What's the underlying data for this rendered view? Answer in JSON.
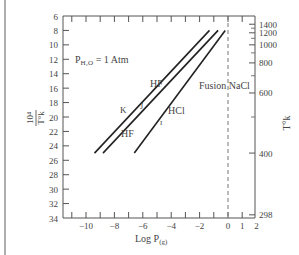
{
  "chart_data": {
    "type": "line",
    "title": "",
    "annotation_condition": "P_H2O = 1 Atm",
    "xlabel": "Log P(g)",
    "ylabel_left": "10^4 / T°K",
    "ylabel_right": "T°K",
    "xlim": [
      -11.5,
      2
    ],
    "ylim_left": [
      6,
      34
    ],
    "x_ticks": [
      -10,
      -8,
      -6,
      -4,
      -2,
      0,
      1,
      2
    ],
    "x_tick_labels": [
      "−10",
      "−8",
      "−6",
      "−4",
      "−2",
      "0",
      "1",
      "2"
    ],
    "y_left_ticks": [
      6,
      8,
      10,
      12,
      14,
      16,
      18,
      20,
      22,
      24,
      26,
      28,
      30,
      32,
      34
    ],
    "y_right_ticks": [
      {
        "label": "1400",
        "inv": 7.14
      },
      {
        "label": "1200",
        "inv": 8.33
      },
      {
        "label": "1000",
        "inv": 10.0
      },
      {
        "label": "800",
        "inv": 12.5
      },
      {
        "label": "600",
        "inv": 16.67
      },
      {
        "label": "400",
        "inv": 25.0
      },
      {
        "label": "298",
        "inv": 33.56
      }
    ],
    "vertical_reference": {
      "x": 0,
      "label": "Fusion NaCl",
      "style": "dashed"
    },
    "series": [
      {
        "name": "K",
        "label_top": "HF",
        "points": [
          [
            -9.4,
            25.0
          ],
          [
            -1.3,
            8.0
          ]
        ]
      },
      {
        "name": "J",
        "label_bottom": "HF",
        "points": [
          [
            -8.8,
            25.0
          ],
          [
            -0.7,
            8.0
          ]
        ]
      },
      {
        "name": "I",
        "label_top": "HCl",
        "points": [
          [
            -6.6,
            25.0
          ],
          [
            -0.2,
            8.0
          ]
        ]
      }
    ],
    "grid": false
  },
  "labels": {
    "condition": "P",
    "condition_sub": "H₂O",
    "condition_tail": " = 1 Atm",
    "hf_upper": "HF",
    "hf_lower": "HF",
    "hcl": "HCl",
    "k": "K",
    "j": "J",
    "i": "I",
    "fusion": "Fusion NaCl",
    "xlabel_main": "Log P",
    "xlabel_sub": "(g)",
    "ylabel_num": "10⁴",
    "ylabel_den": "T°k",
    "ylabel_right": "T°k"
  }
}
